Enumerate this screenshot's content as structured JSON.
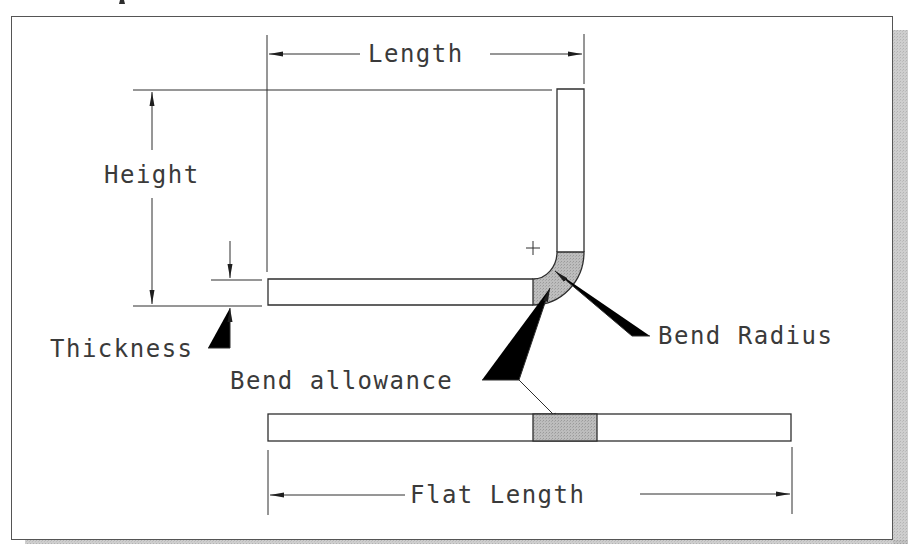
{
  "figure": {
    "type": "sheet-metal bend dimension diagram",
    "colors": {
      "line": "#2e2e2e",
      "text": "#3a3a3a",
      "bend_fill": "#b4b4b4",
      "shadow": "#c8c8c8",
      "frame": "#555555",
      "background": "#ffffff"
    },
    "labels": {
      "length": "Length",
      "height": "Height",
      "thickness": "Thickness",
      "bend_radius": "Bend Radius",
      "bend_allowance": "Bend allowance",
      "flat_length": "Flat Length"
    },
    "annotations": {
      "center_mark": "+"
    }
  }
}
